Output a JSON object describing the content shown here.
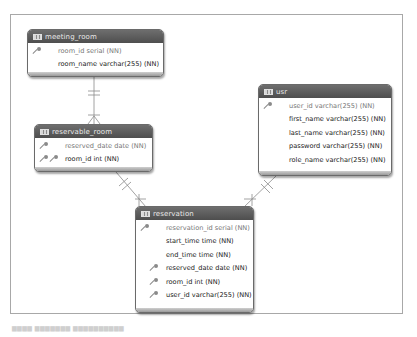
{
  "diagram": {
    "type": "er-diagram",
    "colors": {
      "header_bg": "#5a5a5a",
      "header_text": "#e8e8e8",
      "border": "#6a6a6a",
      "line": "#8a8a8a",
      "pk_text": "#777777",
      "field_text": "#222222"
    },
    "entities": [
      {
        "name": "meeting_room",
        "fields": [
          {
            "label": "room_id serial (NN)",
            "keys": [
              "pk"
            ]
          },
          {
            "label": "room_name varchar(255) (NN)",
            "keys": []
          }
        ]
      },
      {
        "name": "reservable_room",
        "fields": [
          {
            "label": "reserved_date date (NN)",
            "keys": [
              "pk"
            ]
          },
          {
            "label": "room_id int (NN)",
            "keys": [
              "pk",
              "fk"
            ]
          }
        ]
      },
      {
        "name": "usr",
        "fields": [
          {
            "label": "user_id varchar(255) (NN)",
            "keys": [
              "pk"
            ]
          },
          {
            "label": "first_name varchar(255) (NN)",
            "keys": []
          },
          {
            "label": "last_name varchar(255) (NN)",
            "keys": []
          },
          {
            "label": "password varchar(255) (NN)",
            "keys": []
          },
          {
            "label": "role_name varchar(255) (NN)",
            "keys": []
          }
        ]
      },
      {
        "name": "reservation",
        "fields": [
          {
            "label": "reservation_id serial (NN)",
            "keys": [
              "pk"
            ]
          },
          {
            "label": "start_time time (NN)",
            "keys": []
          },
          {
            "label": "end_time time (NN)",
            "keys": []
          },
          {
            "label": "reserved_date date (NN)",
            "keys": [
              "fk"
            ]
          },
          {
            "label": "room_id int (NN)",
            "keys": [
              "fk"
            ]
          },
          {
            "label": "user_id varchar(255) (NN)",
            "keys": [
              "fk"
            ]
          }
        ]
      }
    ],
    "relationships": [
      {
        "from": "meeting_room",
        "to": "reservable_room",
        "from_card": "one",
        "to_card": "many"
      },
      {
        "from": "reservable_room",
        "to": "reservation",
        "from_card": "one",
        "to_card": "many"
      },
      {
        "from": "usr",
        "to": "reservation",
        "from_card": "one",
        "to_card": "many"
      }
    ],
    "icons": {
      "table": "table-icon",
      "primary_key": "key-icon",
      "foreign_key": "key-icon"
    },
    "caption": "▆▆▆▆  ▆▆▆▆▆▆▆  ▆▆▆▆▆▆▆▆▆▆"
  }
}
